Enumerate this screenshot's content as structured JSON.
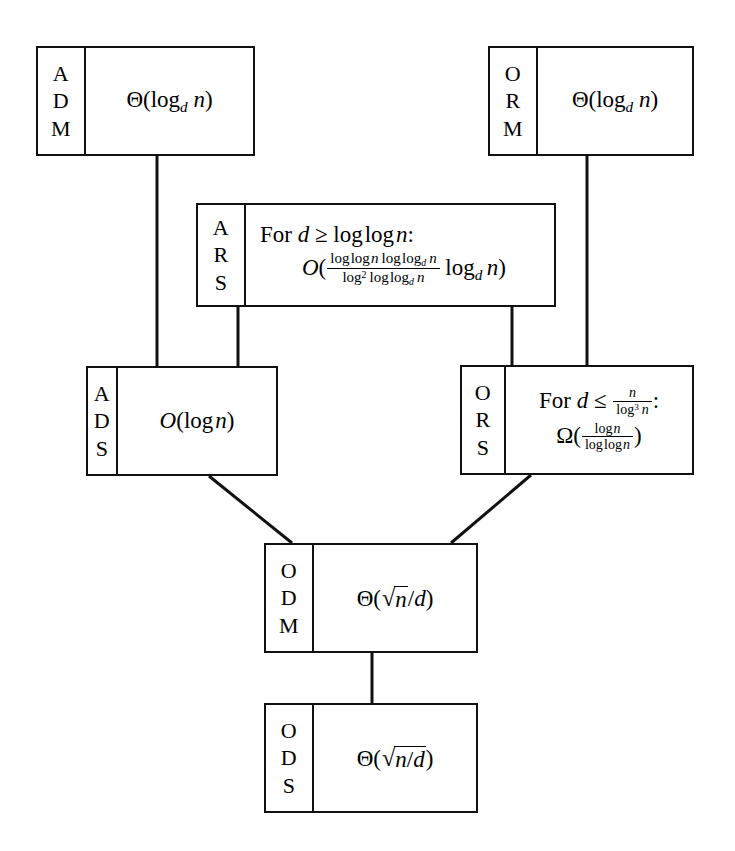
{
  "diagram": {
    "type": "box-and-line hierarchy",
    "nodes": [
      {
        "id": "ADM",
        "tag_letters": [
          "A",
          "D",
          "M"
        ],
        "lines": [
          "Θ(log_d n)"
        ],
        "formula_text": "Θ(log_d n)",
        "x": 36,
        "y": 46,
        "w": 219,
        "h": 110,
        "tag_w": 48
      },
      {
        "id": "ORM",
        "tag_letters": [
          "O",
          "R",
          "M"
        ],
        "lines": [
          "Θ(log_d n)"
        ],
        "formula_text": "Θ(log_d n)",
        "x": 488,
        "y": 46,
        "w": 206,
        "h": 110,
        "tag_w": 48
      },
      {
        "id": "ARS",
        "tag_letters": [
          "A",
          "R",
          "S"
        ],
        "lines": [
          "For d ≥ log log n:",
          "O( (log log n log log_d n) / (log^2 log log_d n) · log_d n )"
        ],
        "condition_text": "For d ≥ log log n:",
        "formula_text": "O( (log log n log log_d n)/(log² log log_d n) log_d n )",
        "x": 196,
        "y": 203,
        "w": 360,
        "h": 104,
        "tag_w": 48
      },
      {
        "id": "ADS",
        "tag_letters": [
          "A",
          "D",
          "S"
        ],
        "lines": [
          "O(log n)"
        ],
        "formula_text": "O(log n)",
        "x": 86,
        "y": 366,
        "w": 192,
        "h": 110,
        "tag_w": 30
      },
      {
        "id": "ORS",
        "tag_letters": [
          "O",
          "R",
          "S"
        ],
        "lines": [
          "For d ≤ n/log^3 n:",
          "Ω( log n / log log n )"
        ],
        "condition_text": "For d ≤ n/log³ n:",
        "formula_text": "Ω(log n / log log n)",
        "x": 460,
        "y": 365,
        "w": 234,
        "h": 110,
        "tag_w": 44
      },
      {
        "id": "ODM",
        "tag_letters": [
          "O",
          "D",
          "M"
        ],
        "lines": [
          "Θ(√n/d)"
        ],
        "formula_text": "Θ(√n/d)",
        "x": 264,
        "y": 543,
        "w": 214,
        "h": 110,
        "tag_w": 48
      },
      {
        "id": "ODS",
        "tag_letters": [
          "O",
          "D",
          "S"
        ],
        "lines": [
          "Θ(√(n/d))"
        ],
        "formula_text": "Θ(√(n/d))",
        "x": 264,
        "y": 703,
        "w": 214,
        "h": 110,
        "tag_w": 48
      }
    ],
    "edges": [
      {
        "from": "ADM",
        "to": "ADS",
        "kind": "vertical"
      },
      {
        "from": "ARS",
        "to": "ADS",
        "kind": "vertical"
      },
      {
        "from": "ORM",
        "to": "ORS",
        "kind": "vertical"
      },
      {
        "from": "ARS",
        "to": "ORS",
        "kind": "vertical"
      },
      {
        "from": "ADS",
        "to": "ODM",
        "kind": "diagonal"
      },
      {
        "from": "ORS",
        "to": "ODM",
        "kind": "diagonal"
      },
      {
        "from": "ODM",
        "to": "ODS",
        "kind": "vertical"
      }
    ],
    "colors": {
      "background": "#ffffff",
      "stroke": "#111111",
      "text": "#000000"
    }
  }
}
